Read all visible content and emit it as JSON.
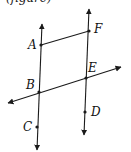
{
  "caption": "(figure)",
  "diagram": {
    "type": "geometry",
    "lines": [
      {
        "id": "line-AC",
        "from": [
          42,
          24
        ],
        "to": [
          37,
          150
        ],
        "arrows": "both"
      },
      {
        "id": "line-FD",
        "from": [
          89,
          9
        ],
        "to": [
          84,
          135
        ],
        "arrows": "both"
      },
      {
        "id": "transversal-BE",
        "from": [
          8,
          103
        ],
        "to": [
          121,
          67
        ],
        "arrows": "both"
      },
      {
        "id": "segment-AF",
        "from": [
          41,
          45
        ],
        "to": [
          89,
          31
        ],
        "arrows": "none"
      }
    ],
    "points": [
      {
        "label": "A",
        "x": 41,
        "y": 45,
        "label_x": 28,
        "label_y": 49
      },
      {
        "label": "F",
        "x": 89,
        "y": 31,
        "label_x": 94,
        "label_y": 33
      },
      {
        "label": "E",
        "x": 86,
        "y": 78,
        "label_x": 88,
        "label_y": 72
      },
      {
        "label": "B",
        "x": 39,
        "y": 92,
        "label_x": 26,
        "label_y": 89
      },
      {
        "label": "D",
        "x": 85,
        "y": 112,
        "label_x": 91,
        "label_y": 116
      },
      {
        "label": "C",
        "x": 37,
        "y": 127,
        "label_x": 23,
        "label_y": 131
      }
    ],
    "stroke_color": "#1a1a1a"
  }
}
